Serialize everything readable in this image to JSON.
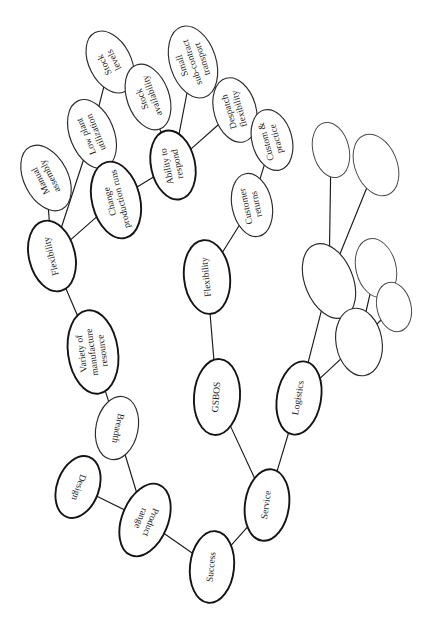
{
  "diagram": {
    "type": "cognitive-map",
    "orientation_note": "diagram rendered rotated; most labels read bottom-to-top",
    "background_color": "#ffffff",
    "node_fill": "#ffffff",
    "node_stroke": "#2b2b2b",
    "edge_color": "#1a1a1a",
    "nodes": [
      {
        "id": "manual-assembly",
        "label": "Manual assembly",
        "lines": [
          "Manual",
          "assembly"
        ],
        "cx": 46,
        "cy": 178,
        "rx": 22,
        "ry": 35,
        "rot": -27,
        "textrot": -90,
        "weight": "normal",
        "fs": 9.5
      },
      {
        "id": "low-plant-utilization",
        "label": "Low plant utilization",
        "lines": [
          "Low plant",
          "utilization"
        ],
        "cx": 92,
        "cy": 134,
        "rx": 22,
        "ry": 36,
        "rot": -22,
        "textrot": -90,
        "weight": "normal",
        "fs": 9.5
      },
      {
        "id": "stock-levels",
        "label": "Stock levels",
        "lines": [
          "Stock",
          "levels"
        ],
        "cx": 110,
        "cy": 62,
        "rx": 21,
        "ry": 33,
        "rot": -27,
        "textrot": -90,
        "weight": "normal",
        "fs": 9.5
      },
      {
        "id": "stock-availability",
        "label": "Stock availability",
        "lines": [
          "Stock",
          "availability"
        ],
        "cx": 148,
        "cy": 97,
        "rx": 21,
        "ry": 34,
        "rot": -20,
        "textrot": -90,
        "weight": "normal",
        "fs": 9.5
      },
      {
        "id": "small-subcontract",
        "label": "Small sub-contract transport",
        "lines": [
          "Small",
          "sub-contract",
          "transport"
        ],
        "cx": 193,
        "cy": 62,
        "rx": 23,
        "ry": 37,
        "rot": -18,
        "textrot": -90,
        "weight": "normal",
        "fs": 9.5
      },
      {
        "id": "despatch-flexibility",
        "label": "Despatch flexibility",
        "lines": [
          "Despatch",
          "flexibility"
        ],
        "cx": 235,
        "cy": 110,
        "rx": 21,
        "ry": 33,
        "rot": -16,
        "textrot": -90,
        "weight": "normal",
        "fs": 9.5
      },
      {
        "id": "custom-practice",
        "label": "Custom & practice",
        "lines": [
          "Custom &",
          "practice"
        ],
        "cx": 272,
        "cy": 140,
        "rx": 20,
        "ry": 31,
        "rot": -15,
        "textrot": -90,
        "weight": "normal",
        "fs": 9.5
      },
      {
        "id": "change-production-runs",
        "label": "Change production runs",
        "lines": [
          "Change",
          "production runs"
        ],
        "cx": 116,
        "cy": 200,
        "rx": 24,
        "ry": 39,
        "rot": -14,
        "textrot": -90,
        "weight": "heavy",
        "fs": 9.5
      },
      {
        "id": "ability-to-respond",
        "label": "Ability to respond",
        "lines": [
          "Ability to",
          "respond"
        ],
        "cx": 173,
        "cy": 165,
        "rx": 22,
        "ry": 35,
        "rot": -12,
        "textrot": -90,
        "weight": "heavy",
        "fs": 9.5
      },
      {
        "id": "customer-returns",
        "label": "Customer returns",
        "lines": [
          "Customer",
          "returns"
        ],
        "cx": 252,
        "cy": 205,
        "rx": 20,
        "ry": 32,
        "rot": -12,
        "textrot": -90,
        "weight": "normal",
        "fs": 9.5
      },
      {
        "id": "flexibility-left",
        "label": "Flexibility",
        "lines": [
          "Flexibility"
        ],
        "cx": 52,
        "cy": 256,
        "rx": 23,
        "ry": 36,
        "rot": -14,
        "textrot": -90,
        "weight": "heavy",
        "fs": 9.5
      },
      {
        "id": "flexibility-right",
        "label": "Flexibility",
        "lines": [
          "Flexibility"
        ],
        "cx": 207,
        "cy": 277,
        "rx": 23,
        "ry": 37,
        "rot": -6,
        "textrot": -90,
        "weight": "heavy",
        "fs": 9.5
      },
      {
        "id": "variety-manufacture",
        "label": "Variety of manufacture resource",
        "lines": [
          "Variety of",
          "manufacture",
          "resource"
        ],
        "cx": 93,
        "cy": 352,
        "rx": 25,
        "ry": 42,
        "rot": -8,
        "textrot": -90,
        "weight": "heavy",
        "fs": 9.5
      },
      {
        "id": "breadth",
        "label": "Breadth",
        "lines": [
          "Breadth"
        ],
        "cx": 117,
        "cy": 428,
        "rx": 21,
        "ry": 32,
        "rot": 12,
        "textrot": 90,
        "weight": "normal",
        "fs": 9.5
      },
      {
        "id": "design",
        "label": "Design",
        "lines": [
          "Design"
        ],
        "cx": 78,
        "cy": 487,
        "rx": 21,
        "ry": 32,
        "rot": 20,
        "textrot": 90,
        "weight": "heavy",
        "fs": 9.5
      },
      {
        "id": "product-range",
        "label": "Product range",
        "lines": [
          "Product",
          "range"
        ],
        "cx": 145,
        "cy": 520,
        "rx": 23,
        "ry": 38,
        "rot": 22,
        "textrot": 90,
        "weight": "heavy",
        "fs": 9.5
      },
      {
        "id": "success",
        "label": "Success",
        "lines": [
          "Success"
        ],
        "cx": 212,
        "cy": 567,
        "rx": 22,
        "ry": 36,
        "rot": 6,
        "textrot": -90,
        "weight": "heavy",
        "fs": 9.5
      },
      {
        "id": "service",
        "label": "Service",
        "lines": [
          "Service"
        ],
        "cx": 267,
        "cy": 505,
        "rx": 22,
        "ry": 36,
        "rot": 8,
        "textrot": -90,
        "weight": "heavy",
        "fs": 9.5
      },
      {
        "id": "gsbos",
        "label": "GSBOS",
        "lines": [
          "GSBOS"
        ],
        "cx": 217,
        "cy": 397,
        "rx": 23,
        "ry": 38,
        "rot": 4,
        "textrot": -90,
        "weight": "heavy",
        "fs": 9.5
      },
      {
        "id": "logistics",
        "label": "Logistics",
        "lines": [
          "Logistics"
        ],
        "cx": 299,
        "cy": 398,
        "rx": 22,
        "ry": 37,
        "rot": 10,
        "textrot": -90,
        "weight": "heavy",
        "fs": 9.5
      },
      {
        "id": "blank-a",
        "label": "",
        "lines": [],
        "cx": 331,
        "cy": 150,
        "rx": 18,
        "ry": 28,
        "rot": -14,
        "textrot": -90,
        "weight": "light",
        "fs": 9.5
      },
      {
        "id": "blank-b",
        "label": "",
        "lines": [],
        "cx": 376,
        "cy": 165,
        "rx": 21,
        "ry": 32,
        "rot": -22,
        "textrot": -90,
        "weight": "light",
        "fs": 9.5
      },
      {
        "id": "blank-c",
        "label": "",
        "lines": [],
        "cx": 329,
        "cy": 281,
        "rx": 24,
        "ry": 39,
        "rot": -22,
        "textrot": -90,
        "weight": "normal",
        "fs": 9.5
      },
      {
        "id": "blank-d",
        "label": "",
        "lines": [],
        "cx": 376,
        "cy": 268,
        "rx": 20,
        "ry": 30,
        "rot": -14,
        "textrot": -90,
        "weight": "light",
        "fs": 9.5
      },
      {
        "id": "blank-e",
        "label": "",
        "lines": [],
        "cx": 394,
        "cy": 307,
        "rx": 17,
        "ry": 25,
        "rot": -14,
        "textrot": -90,
        "weight": "light",
        "fs": 9.5
      },
      {
        "id": "blank-f",
        "label": "",
        "lines": [],
        "cx": 359,
        "cy": 342,
        "rx": 23,
        "ry": 34,
        "rot": -10,
        "textrot": -90,
        "weight": "normal",
        "fs": 9.5
      }
    ],
    "edges": [
      {
        "from": "manual-assembly",
        "to": "flexibility-left"
      },
      {
        "from": "low-plant-utilization",
        "to": "flexibility-left"
      },
      {
        "from": "low-plant-utilization",
        "to": "stock-levels"
      },
      {
        "from": "stock-levels",
        "to": "stock-availability"
      },
      {
        "from": "stock-availability",
        "to": "ability-to-respond"
      },
      {
        "from": "small-subcontract",
        "to": "ability-to-respond"
      },
      {
        "from": "small-subcontract",
        "to": "despatch-flexibility"
      },
      {
        "from": "despatch-flexibility",
        "to": "ability-to-respond"
      },
      {
        "from": "despatch-flexibility",
        "to": "custom-practice"
      },
      {
        "from": "custom-practice",
        "to": "customer-returns"
      },
      {
        "from": "change-production-runs",
        "to": "flexibility-left"
      },
      {
        "from": "change-production-runs",
        "to": "ability-to-respond"
      },
      {
        "from": "customer-returns",
        "to": "flexibility-right"
      },
      {
        "from": "flexibility-left",
        "to": "variety-manufacture"
      },
      {
        "from": "flexibility-right",
        "to": "gsbos"
      },
      {
        "from": "variety-manufacture",
        "to": "breadth"
      },
      {
        "from": "breadth",
        "to": "product-range"
      },
      {
        "from": "design",
        "to": "product-range"
      },
      {
        "from": "product-range",
        "to": "success"
      },
      {
        "from": "success",
        "to": "service"
      },
      {
        "from": "service",
        "to": "gsbos"
      },
      {
        "from": "service",
        "to": "logistics"
      },
      {
        "from": "logistics",
        "to": "blank-c"
      },
      {
        "from": "logistics",
        "to": "blank-f"
      },
      {
        "from": "blank-c",
        "to": "blank-a"
      },
      {
        "from": "blank-c",
        "to": "blank-b"
      },
      {
        "from": "blank-f",
        "to": "blank-d"
      },
      {
        "from": "blank-f",
        "to": "blank-e"
      }
    ]
  }
}
